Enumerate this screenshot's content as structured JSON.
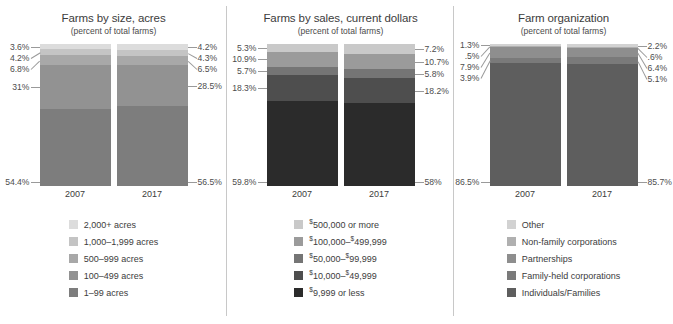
{
  "chart_data": [
    {
      "type": "bar",
      "title": "Farms by size, acres",
      "subtitle": "(percent of total farms)",
      "xlabel": "",
      "ylabel": "",
      "ylim": [
        0,
        100
      ],
      "grid": false,
      "legend_position": "bottom",
      "stacked": true,
      "categories": [
        "2007",
        "2017"
      ],
      "series": [
        {
          "name": "2,000+ acres",
          "values": [
            3.6,
            4.2
          ],
          "labels": [
            "3.6%",
            "4.2%"
          ],
          "color": "#dcdcdc"
        },
        {
          "name": "1,000–1,999 acres",
          "values": [
            4.2,
            4.3
          ],
          "labels": [
            "4.2%",
            "4.3%"
          ],
          "color": "#c4c4c4"
        },
        {
          "name": "500–999 acres",
          "values": [
            6.8,
            6.5
          ],
          "labels": [
            "6.8%",
            "6.5%"
          ],
          "color": "#a8a8a8"
        },
        {
          "name": "100–499 acres",
          "values": [
            31.0,
            28.5
          ],
          "labels": [
            "31%",
            "28.5%"
          ],
          "color": "#929292"
        },
        {
          "name": "1–99 acres",
          "values": [
            54.4,
            56.5
          ],
          "labels": [
            "54.4%",
            "56.5%"
          ],
          "color": "#7d7d7d"
        }
      ]
    },
    {
      "type": "bar",
      "title": "Farms by sales, current dollars",
      "subtitle": "(percent of total farms)",
      "xlabel": "",
      "ylabel": "",
      "ylim": [
        0,
        100
      ],
      "grid": false,
      "legend_position": "bottom",
      "stacked": true,
      "categories": [
        "2007",
        "2017"
      ],
      "series": [
        {
          "name": "$500,000 or more",
          "values": [
            5.3,
            7.2
          ],
          "labels": [
            "5.3%",
            "7.2%"
          ],
          "color": "#c9c9c9",
          "label_html": "<sup>$</sup>500,000 or more"
        },
        {
          "name": "$100,000–$499,999",
          "values": [
            10.9,
            10.7
          ],
          "labels": [
            "10.9%",
            "10.7%"
          ],
          "color": "#9b9b9b",
          "label_html": "<sup>$</sup>100,000–<sup>$</sup>499,999"
        },
        {
          "name": "$50,000–$99,999",
          "values": [
            5.7,
            5.8
          ],
          "labels": [
            "5.7%",
            "5.8%"
          ],
          "color": "#757575",
          "label_html": "<sup>$</sup>50,000–<sup>$</sup>99,999"
        },
        {
          "name": "$10,000–$49,999",
          "values": [
            18.3,
            18.2
          ],
          "labels": [
            "18.3%",
            "18.2%"
          ],
          "color": "#4e4e4e",
          "label_html": "<sup>$</sup>10,000–<sup>$</sup>49,999"
        },
        {
          "name": "$9,999 or less",
          "values": [
            59.8,
            58.0
          ],
          "labels": [
            "59.8%",
            "58%"
          ],
          "color": "#2b2b2b",
          "label_html": "<sup>$</sup>9,999 or less"
        }
      ]
    },
    {
      "type": "bar",
      "title": "Farm organization",
      "subtitle": "(percent of total farms)",
      "xlabel": "",
      "ylabel": "",
      "ylim": [
        0,
        100
      ],
      "grid": false,
      "legend_position": "bottom",
      "stacked": true,
      "categories": [
        "2007",
        "2017"
      ],
      "series": [
        {
          "name": "Other",
          "values": [
            1.3,
            2.2
          ],
          "labels": [
            "1.3%",
            "2.2%"
          ],
          "color": "#d2d2d2"
        },
        {
          "name": "Non-family corporations",
          "values": [
            0.5,
            0.6
          ],
          "labels": [
            ".5%",
            ".6%"
          ],
          "color": "#b0b0b0"
        },
        {
          "name": "Partnerships",
          "values": [
            7.9,
            6.4
          ],
          "labels": [
            "7.9%",
            "6.4%"
          ],
          "color": "#8e8e8e"
        },
        {
          "name": "Family-held corporations",
          "values": [
            3.9,
            5.1
          ],
          "labels": [
            "3.9%",
            "5.1%"
          ],
          "color": "#7a7a7a"
        },
        {
          "name": "Individuals/Families",
          "values": [
            86.5,
            85.7
          ],
          "labels": [
            "86.5%",
            "85.7%"
          ],
          "color": "#5e5e5e"
        }
      ]
    }
  ]
}
